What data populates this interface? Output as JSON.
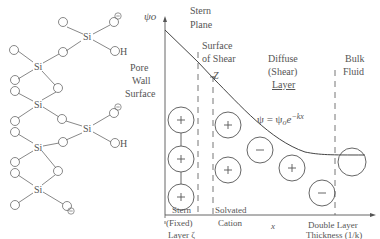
{
  "silica": {
    "si_label": "Si",
    "oh_label": "H",
    "negative_charge": "−",
    "atoms": [
      {
        "si": [
          58,
          36
        ],
        "groups": "top"
      },
      {
        "si": [
          35,
          65
        ]
      },
      {
        "si": [
          85,
          76
        ]
      },
      {
        "si": [
          35,
          104
        ]
      },
      {
        "si": [
          85,
          128
        ]
      },
      {
        "si": [
          35,
          143
        ]
      },
      {
        "si": [
          35,
          183
        ]
      }
    ]
  },
  "diagram": {
    "y_axis_label": "ψo",
    "x_axis_label": "x",
    "stern_plane": "Stern\nPlane",
    "stern_plane_l1": "Stern",
    "stern_plane_l2": "Plane",
    "shear_l1": "Surface",
    "shear_l2": "of Shear",
    "zeta_marker": "Z",
    "pore_l1": "Pore",
    "pore_l2": "Wall",
    "pore_l3": "Surface",
    "diffuse_l1": "Diffuse",
    "diffuse_l2": "(Shear)",
    "diffuse_l3": "Layer",
    "bulk_l1": "Bulk",
    "bulk_l2": "Fluid",
    "equation": "ψ = ψoe−kx",
    "eq_psi": "ψ = ψ",
    "eq_sub": "o",
    "eq_e": "e",
    "eq_exp": "−kx",
    "stern_layer_l1": "Stern",
    "stern_layer_l2": "(Fixed)",
    "stern_layer_l3": "Layer ζ",
    "solvated_l1": "Solvated",
    "solvated_l2": "Cation",
    "dl_l1": "Double Layer",
    "dl_l2": "Thickness (1/k)",
    "ions": [
      {
        "x": 181,
        "y": 120,
        "r": 13,
        "sign": "+"
      },
      {
        "x": 181,
        "y": 159,
        "r": 13,
        "sign": "+"
      },
      {
        "x": 181,
        "y": 197,
        "r": 13,
        "sign": "+"
      },
      {
        "x": 228,
        "y": 125,
        "r": 13,
        "sign": "+"
      },
      {
        "x": 228,
        "y": 170,
        "r": 13,
        "sign": "+"
      },
      {
        "x": 260,
        "y": 150,
        "r": 13,
        "sign": "−"
      },
      {
        "x": 292,
        "y": 168,
        "r": 13,
        "sign": "+"
      },
      {
        "x": 322,
        "y": 193,
        "r": 13,
        "sign": "−"
      },
      {
        "x": 352,
        "y": 162,
        "r": 14,
        "sign": ""
      }
    ]
  },
  "colors": {
    "line": "#555555",
    "text": "#555555",
    "background": "#ffffff"
  }
}
